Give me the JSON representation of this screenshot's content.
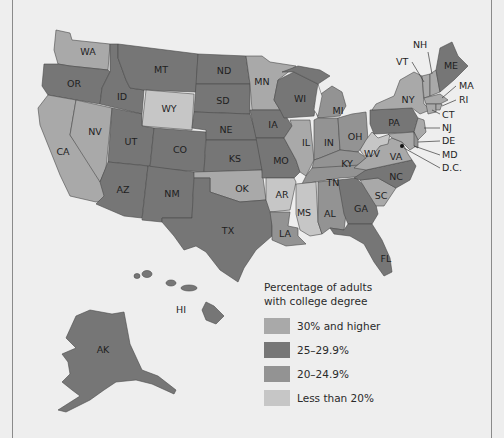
{
  "legend": {
    "title_line1": "Percentage of adults",
    "title_line2": "with college degree",
    "items": [
      {
        "label": "30% and higher",
        "color": "#a9a9a9"
      },
      {
        "label": "25–29.9%",
        "color": "#767676"
      },
      {
        "label": "20–24.9%",
        "color": "#939393"
      },
      {
        "label": "Less than 20%",
        "color": "#c6c6c6"
      }
    ]
  },
  "states": {
    "WA": "WA",
    "OR": "OR",
    "CA": "CA",
    "NV": "NV",
    "ID": "ID",
    "MT": "MT",
    "WY": "WY",
    "UT": "UT",
    "CO": "CO",
    "AZ": "AZ",
    "NM": "NM",
    "ND": "ND",
    "SD": "SD",
    "NE": "NE",
    "KS": "KS",
    "OK": "OK",
    "TX": "TX",
    "MN": "MN",
    "IA": "IA",
    "MO": "MO",
    "AR": "AR",
    "LA": "LA",
    "WI": "WI",
    "IL": "IL",
    "MI": "MI",
    "IN": "IN",
    "OH": "OH",
    "KY": "KY",
    "TN": "TN",
    "MS": "MS",
    "AL": "AL",
    "GA": "GA",
    "FL": "FL",
    "SC": "SC",
    "NC": "NC",
    "VA": "VA",
    "WV": "WV",
    "PA": "PA",
    "NY": "NY",
    "AK": "AK",
    "HI": "HI",
    "ME": "ME"
  },
  "callouts": {
    "NH": "NH",
    "VT": "VT",
    "MA": "MA",
    "RI": "RI",
    "CT": "CT",
    "NJ": "NJ",
    "DE": "DE",
    "MD": "MD",
    "DC": "D.C."
  }
}
